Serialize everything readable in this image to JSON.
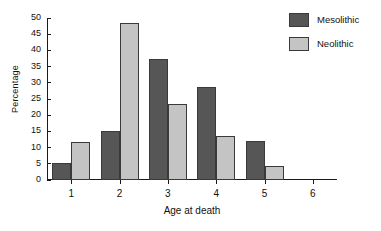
{
  "chart_data": {
    "type": "bar",
    "title": "",
    "xlabel": "Age at death",
    "ylabel": "Percentage",
    "categories": [
      "1",
      "2",
      "3",
      "4",
      "5",
      "6"
    ],
    "series": [
      {
        "name": "Mesolithic",
        "color": "#565656",
        "values": [
          5.2,
          15.0,
          37.3,
          28.6,
          12.0,
          0
        ]
      },
      {
        "name": "Neolithic",
        "color": "#c4c4c4",
        "values": [
          11.8,
          48.5,
          23.6,
          13.6,
          4.3,
          0
        ]
      }
    ],
    "ylim": [
      0,
      50
    ],
    "yticks": [
      0,
      5,
      10,
      15,
      20,
      25,
      30,
      35,
      40,
      45,
      50
    ],
    "ytick_labels": [
      "0",
      "5",
      "10",
      "15",
      "20",
      "25",
      "30",
      "35",
      "40",
      "45",
      "50"
    ],
    "grid": false,
    "legend_position": "top-right"
  },
  "legend": {
    "entries": [
      {
        "label": "Mesolithic"
      },
      {
        "label": "Neolithic"
      }
    ]
  }
}
